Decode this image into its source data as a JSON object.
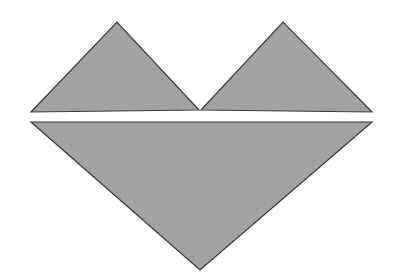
{
  "figure": {
    "canvas": {
      "width": 394,
      "height": 280,
      "background": "#ffffff"
    },
    "style": {
      "fill": "#a3a3a3",
      "fill_texture": "halftone-dither",
      "outline": "#3a3a3a",
      "outline_width": 1.2,
      "gap_color": "#ffffff"
    },
    "shapes": [
      {
        "name": "upper-left-triangle",
        "kind": "triangle",
        "points": "31,112 117,22 199,110 31,112",
        "vertices": [
          {
            "label": "left-tip",
            "x": 31,
            "y": 112
          },
          {
            "label": "apex",
            "x": 117,
            "y": 22
          },
          {
            "label": "valley",
            "x": 199,
            "y": 110
          }
        ]
      },
      {
        "name": "upper-right-triangle",
        "kind": "triangle",
        "points": "201,110 283,22 372,112 201,110",
        "vertices": [
          {
            "label": "valley",
            "x": 201,
            "y": 110
          },
          {
            "label": "apex",
            "x": 283,
            "y": 22
          },
          {
            "label": "right-tip",
            "x": 372,
            "y": 112
          }
        ]
      },
      {
        "name": "lower-large-triangle",
        "kind": "triangle",
        "points": "31,122 372,122 200,270 31,122",
        "vertices": [
          {
            "label": "left-tip",
            "x": 31,
            "y": 122
          },
          {
            "label": "right-tip",
            "x": 372,
            "y": 122
          },
          {
            "label": "bottom-apex",
            "x": 200,
            "y": 270
          }
        ]
      }
    ],
    "gap": {
      "name": "horizontal-white-gap",
      "y_top": 113,
      "y_bottom": 121,
      "x_left": 31,
      "x_right": 372
    }
  }
}
